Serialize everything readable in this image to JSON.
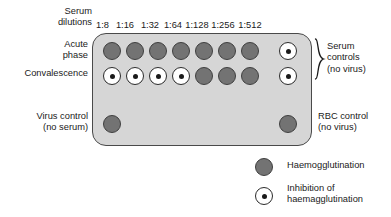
{
  "diagram": {
    "serum_dilution_header": "Serum\ndilutions",
    "dilutions": [
      "1:8",
      "1:16",
      "1:32",
      "1:64",
      "1:128",
      "1:256",
      "1:512"
    ],
    "row_labels": {
      "acute": "Acute\nphase",
      "convalescence": "Convalescence",
      "virus_control": "Virus control\n(no serum)",
      "rbc_control": "RBC control\n(no virus)",
      "serum_controls": "Serum\ncontrols\n(no virus)"
    },
    "rows": [
      {
        "name": "acute-phase",
        "label": "Acute phase",
        "wells": [
          "agg",
          "agg",
          "agg",
          "agg",
          "agg",
          "agg",
          "agg"
        ],
        "control_well": "inh"
      },
      {
        "name": "convalescence",
        "label": "Convalescence",
        "wells": [
          "inh",
          "inh",
          "inh",
          "inh",
          "agg",
          "agg",
          "agg"
        ],
        "control_well": "inh"
      }
    ],
    "bottom_controls": {
      "virus_control_well": "agg",
      "rbc_control_well": "agg"
    },
    "legend": [
      {
        "symbol": "agg",
        "label": "Haemogglutination"
      },
      {
        "symbol": "inh",
        "label": "Inhibition of\nhaemagglutination"
      }
    ],
    "colors": {
      "plate_fill": "#d6d6d6",
      "plate_border": "#4a4a4a",
      "agglutination_fill": "#737373",
      "agglutination_border": "#3f3f3f",
      "inhibition_fill": "#ffffff",
      "inhibition_border": "#2b2b2b",
      "text": "#1a1a1a"
    }
  }
}
